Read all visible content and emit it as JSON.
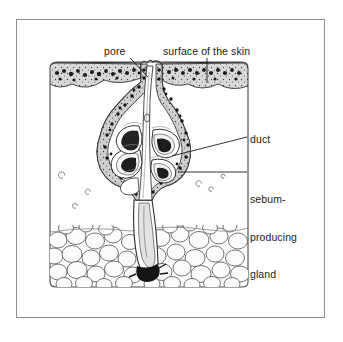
{
  "figure": {
    "kind": "anatomical-diagram",
    "background_color": "#ffffff",
    "frame_color": "#8c8c92",
    "ink_color": "#1b1b1b"
  },
  "labels": {
    "pore": "pore",
    "surface": "surface of the skin",
    "duct": "duct",
    "sebum_line1": "sebum-",
    "sebum_line2": "producing",
    "sebum_line3": "gland"
  },
  "regions": {
    "epidermis": "epidermis",
    "dermis": "dermis",
    "fat": "subcutaneous fat cells",
    "follicle": "hair follicle",
    "gland_lobes": "sebaceous gland lobes"
  }
}
